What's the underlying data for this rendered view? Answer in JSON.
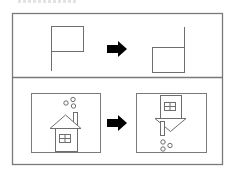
{
  "figure": {
    "type": "transformation-puzzle",
    "colors": {
      "frame": "#7a7a7a",
      "line": "#6e6e6e",
      "arrow": "#000000",
      "background": "#ffffff"
    },
    "rows": [
      {
        "name": "example-row",
        "before": {
          "shape": "flag",
          "orientation": "upright",
          "description": "flag on left pole, pennant at top right"
        },
        "arrow": "right-arrow",
        "after": {
          "shape": "flag",
          "orientation": "rotated-180",
          "description": "flag with pole on right, pennant at bottom left"
        }
      },
      {
        "name": "question-row",
        "before": {
          "shape": "house",
          "orientation": "upright",
          "description": "house with window, chimney and smoke circles above"
        },
        "arrow": "right-arrow",
        "after": {
          "shape": "house",
          "orientation": "rotated-180",
          "description": "inverted house with roof pointing down, smoke circles below"
        }
      }
    ]
  }
}
